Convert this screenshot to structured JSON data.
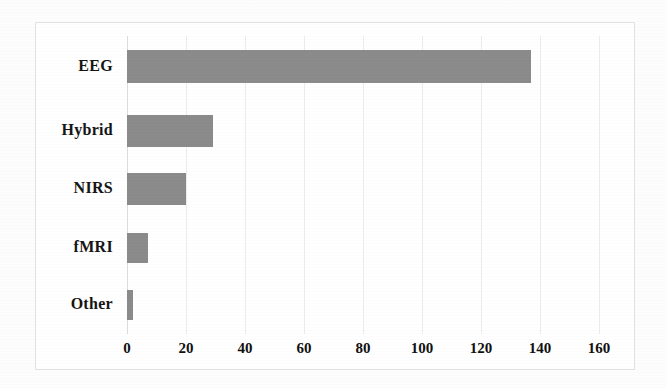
{
  "chart_data": {
    "type": "bar",
    "orientation": "horizontal",
    "title": "",
    "subtitle": "",
    "xlabel": "",
    "ylabel": "",
    "categories": [
      "EEG",
      "Hybrid",
      "NIRS",
      "fMRI",
      "Other"
    ],
    "values": [
      137,
      29,
      20,
      7,
      2
    ],
    "series": [
      {
        "name": "Number of studies",
        "values": [
          137,
          29,
          20,
          7,
          2
        ]
      }
    ],
    "xlim": [
      0,
      160
    ],
    "xticks": [
      0,
      20,
      40,
      60,
      80,
      100,
      120,
      140,
      160
    ],
    "xtick_labels": [
      "0",
      "20",
      "40",
      "60",
      "80",
      "100",
      "120",
      "140",
      "160"
    ],
    "grid": true,
    "grid_axis": "x",
    "legend": false,
    "legend_position": "none",
    "bar_color": "#8b8b8b",
    "plot_background": "#ffffff",
    "frame_color": "#e2e2e2",
    "gridline_color": "#ececec",
    "annotations": []
  },
  "figure": {
    "background": "#fdfdfd",
    "border_color": "#e2e2e2"
  }
}
